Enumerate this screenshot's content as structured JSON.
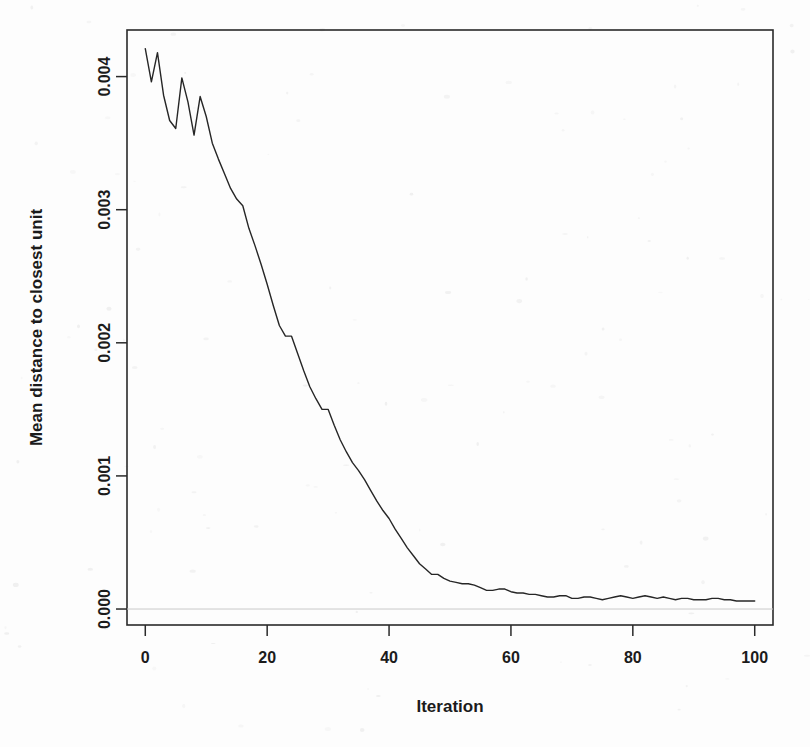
{
  "figure": {
    "background_color": "#fdfdfd",
    "line_color": "#262626",
    "axis_color": "#2a2a2a",
    "gridline_color": "#c9c9c9"
  },
  "chart_data": {
    "type": "line",
    "title": "",
    "subtitle": "",
    "xlabel": "Iteration",
    "ylabel": "Mean distance to closest unit",
    "xlim": [
      -3,
      103
    ],
    "ylim": [
      -0.00012,
      0.00435
    ],
    "grid": false,
    "legend": null,
    "xticks": [
      0,
      20,
      40,
      60,
      80,
      100
    ],
    "xticklabels": [
      "0",
      "20",
      "40",
      "60",
      "80",
      "100"
    ],
    "yticks": [
      0.0,
      0.001,
      0.002,
      0.003,
      0.004
    ],
    "yticklabels": [
      "0.000",
      "0.001",
      "0.002",
      "0.003",
      "0.004"
    ],
    "annotations": [],
    "series": [
      {
        "name": "Mean distance to closest unit",
        "x": [
          0,
          1,
          2,
          3,
          4,
          5,
          6,
          7,
          8,
          9,
          10,
          11,
          12,
          13,
          14,
          15,
          16,
          17,
          18,
          19,
          20,
          21,
          22,
          23,
          24,
          25,
          26,
          27,
          28,
          29,
          30,
          31,
          32,
          33,
          34,
          35,
          36,
          37,
          38,
          39,
          40,
          41,
          42,
          43,
          44,
          45,
          46,
          47,
          48,
          49,
          50,
          51,
          52,
          53,
          54,
          55,
          56,
          57,
          58,
          59,
          60,
          61,
          62,
          63,
          64,
          65,
          66,
          67,
          68,
          69,
          70,
          71,
          72,
          73,
          74,
          75,
          76,
          77,
          78,
          79,
          80,
          81,
          82,
          83,
          84,
          85,
          86,
          87,
          88,
          89,
          90,
          91,
          92,
          93,
          94,
          95,
          96,
          97,
          98,
          99,
          100
        ],
        "values": [
          0.00421,
          0.00396,
          0.00418,
          0.00386,
          0.00367,
          0.00361,
          0.00399,
          0.00381,
          0.00356,
          0.00385,
          0.0037,
          0.0035,
          0.00338,
          0.00327,
          0.00316,
          0.00308,
          0.00303,
          0.00286,
          0.00273,
          0.00259,
          0.00244,
          0.00228,
          0.00213,
          0.00205,
          0.00205,
          0.00192,
          0.00179,
          0.00167,
          0.00158,
          0.0015,
          0.0015,
          0.00138,
          0.00127,
          0.00118,
          0.0011,
          0.00104,
          0.00097,
          0.00089,
          0.00081,
          0.00074,
          0.00068,
          0.0006,
          0.00053,
          0.00046,
          0.0004,
          0.00034,
          0.0003,
          0.00026,
          0.00026,
          0.00023,
          0.00021,
          0.0002,
          0.00019,
          0.00019,
          0.00018,
          0.00016,
          0.00014,
          0.00014,
          0.00015,
          0.00015,
          0.00013,
          0.00012,
          0.00012,
          0.00011,
          0.00011,
          0.0001,
          9e-05,
          9e-05,
          0.0001,
          0.0001,
          8e-05,
          8e-05,
          9e-05,
          9e-05,
          8e-05,
          7e-05,
          8e-05,
          9e-05,
          0.0001,
          9e-05,
          8e-05,
          9e-05,
          0.0001,
          9e-05,
          8e-05,
          9e-05,
          8e-05,
          7e-05,
          8e-05,
          8e-05,
          7e-05,
          7e-05,
          7e-05,
          8e-05,
          8e-05,
          7e-05,
          7e-05,
          6e-05,
          6e-05,
          6e-05,
          6e-05
        ]
      }
    ]
  }
}
